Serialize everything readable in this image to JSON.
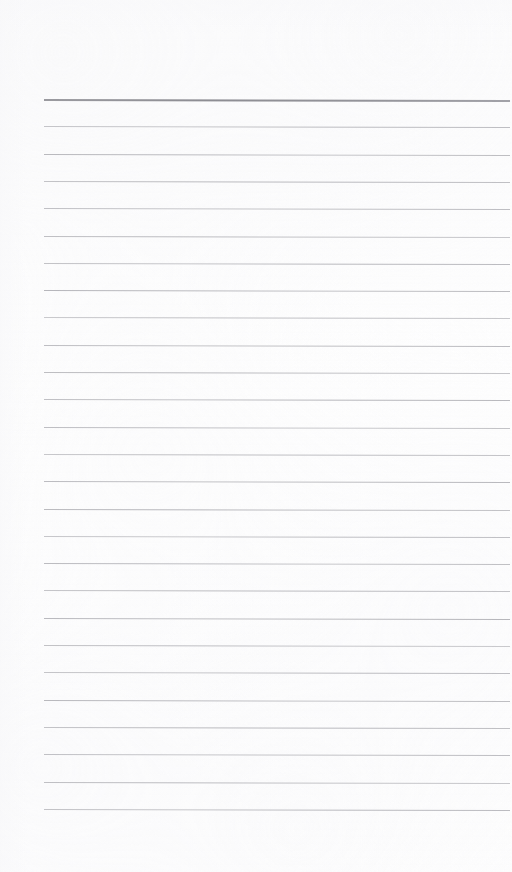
{
  "document": {
    "type": "lined-notebook-page",
    "title": "Lined Notebook Page",
    "orientation": "portrait",
    "page_width_px": 512,
    "page_height_px": 872,
    "background_color": "#fefefe",
    "content_text": "",
    "has_handwriting": false,
    "has_margin_line": false
  },
  "ruling": {
    "line_color": "#b9b9bd",
    "header_rule_color": "#8d8d93",
    "line_left_x": 44,
    "line_right_x": 510,
    "line_width_px": 466,
    "line_spacing_px": 27.3,
    "first_line_y": 99,
    "last_line_y": 810,
    "line_count": 27,
    "header_rule_index": 0,
    "header_rule_thickness_px": 2,
    "body_rule_thickness_px": 1,
    "skew_deg": 0.12,
    "lines_y": [
      99.0,
      126.3,
      153.6,
      180.9,
      208.2,
      235.5,
      262.8,
      290.1,
      317.4,
      344.7,
      372.0,
      399.3,
      426.6,
      453.9,
      481.2,
      508.5,
      535.8,
      563.1,
      590.4,
      617.7,
      645.0,
      672.3,
      699.6,
      726.9,
      754.2,
      781.5,
      808.8
    ]
  },
  "margins": {
    "top_blank_px": 99,
    "bottom_blank_px": 62,
    "left_px": 44,
    "right_px": 2
  }
}
